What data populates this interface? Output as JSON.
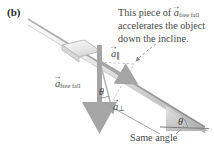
{
  "figure": {
    "panel_label": "(b)",
    "callout": {
      "line1": "This piece of",
      "vector_base": "a",
      "vector_subscript": "free fall",
      "line2": "accelerates the object",
      "line3": "down the incline."
    },
    "same_angle_label": "Same angle",
    "vectors": [
      {
        "name": "a-free-fall",
        "base": "a",
        "subscript": "free fall"
      },
      {
        "name": "a-parallel",
        "base": "a",
        "subscript": "∥"
      },
      {
        "name": "a-perpendicular",
        "base": "a",
        "subscript": "⊥"
      }
    ],
    "angles": {
      "top_symbol": "θ",
      "bottom_symbol": "θ"
    },
    "colors": {
      "incline_light": "#f2f2f2",
      "incline_mid": "#d2d2d2",
      "incline_dark": "#9a9a9a",
      "arrow_gray": "#a8a8a8",
      "arrow_dark": "#8c8c8c",
      "text": "#4a4a4a",
      "background": "#ffffff"
    }
  }
}
